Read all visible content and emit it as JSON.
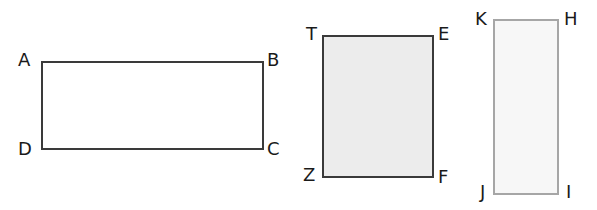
{
  "diagram": {
    "type": "rectangles",
    "shapes": [
      {
        "name": "ABCD",
        "fill": "#ffffff",
        "stroke": "#3a3a3a",
        "stroke_width": 2,
        "box": {
          "x": 41,
          "y": 61,
          "w": 223,
          "h": 89
        },
        "vertices": [
          {
            "label": "A",
            "x": 18,
            "y": 51
          },
          {
            "label": "B",
            "x": 267,
            "y": 51
          },
          {
            "label": "C",
            "x": 267,
            "y": 140
          },
          {
            "label": "D",
            "x": 18,
            "y": 140
          }
        ]
      },
      {
        "name": "TEFZ",
        "fill": "#ececec",
        "stroke": "#3a3a3a",
        "stroke_width": 2,
        "box": {
          "x": 322,
          "y": 35,
          "w": 112,
          "h": 143
        },
        "vertices": [
          {
            "label": "T",
            "x": 306,
            "y": 25
          },
          {
            "label": "E",
            "x": 438,
            "y": 25
          },
          {
            "label": "F",
            "x": 438,
            "y": 168
          },
          {
            "label": "Z",
            "x": 303,
            "y": 166
          }
        ]
      },
      {
        "name": "KHIJ",
        "fill": "#f7f7f7",
        "stroke": "#a6a6a6",
        "stroke_width": 2,
        "box": {
          "x": 493,
          "y": 19,
          "w": 66,
          "h": 176
        },
        "vertices": [
          {
            "label": "K",
            "x": 475,
            "y": 10
          },
          {
            "label": "H",
            "x": 564,
            "y": 10
          },
          {
            "label": "I",
            "x": 566,
            "y": 183
          },
          {
            "label": "J",
            "x": 480,
            "y": 183
          }
        ]
      }
    ]
  }
}
